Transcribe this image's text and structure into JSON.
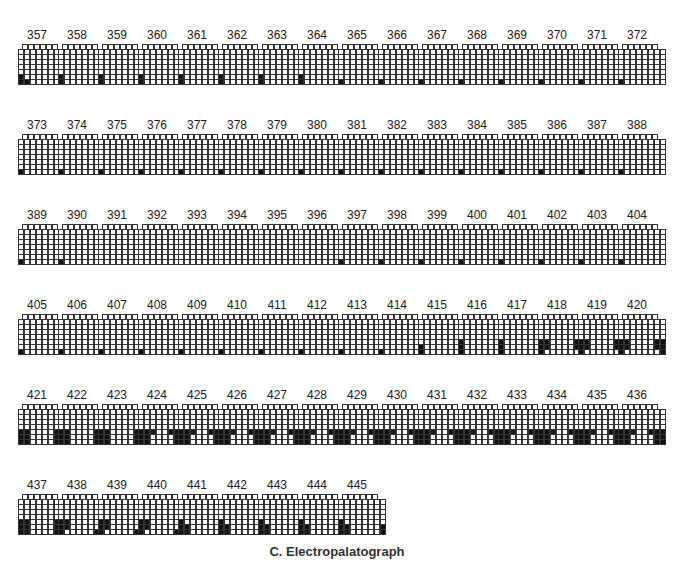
{
  "caption": "C. Electropalatograph",
  "grid_spec": {
    "rows": 8,
    "row0_cells": 6,
    "other_row_cells": 8
  },
  "layout": {
    "row_tops": [
      28,
      118,
      208,
      298,
      388,
      478
    ],
    "col_lefts": [
      18,
      58,
      98,
      138,
      178,
      218,
      258,
      298,
      338,
      378,
      418,
      458,
      498,
      538,
      578,
      618
    ],
    "per_row": 16
  },
  "patterns": {
    "p_cornersL2R1": [
      [
        6,
        0
      ],
      [
        7,
        0
      ],
      [
        7,
        1
      ],
      [
        6,
        7
      ],
      [
        7,
        7
      ]
    ],
    "p_cornersL2R1b": [
      [
        6,
        0
      ],
      [
        7,
        0
      ],
      [
        7,
        7
      ]
    ],
    "p_L2": [
      [
        6,
        0
      ],
      [
        7,
        0
      ]
    ],
    "p_L1": [
      [
        7,
        0
      ]
    ],
    "p_none": [],
    "p_L1R1": [
      [
        7,
        0
      ],
      [
        7,
        7
      ]
    ],
    "p_L2R2": [
      [
        6,
        0
      ],
      [
        7,
        0
      ],
      [
        6,
        7
      ],
      [
        7,
        7
      ]
    ],
    "p_L2R2w": [
      [
        5,
        0
      ],
      [
        6,
        0
      ],
      [
        7,
        0
      ],
      [
        5,
        7
      ],
      [
        6,
        7
      ],
      [
        7,
        7
      ]
    ],
    "p_418": [
      [
        5,
        0
      ],
      [
        5,
        1
      ],
      [
        5,
        6
      ],
      [
        5,
        7
      ],
      [
        6,
        0
      ],
      [
        6,
        1
      ],
      [
        6,
        6
      ],
      [
        6,
        7
      ],
      [
        7,
        0
      ],
      [
        7,
        7
      ]
    ],
    "p_wide": [
      [
        5,
        0
      ],
      [
        5,
        1
      ],
      [
        5,
        2
      ],
      [
        5,
        5
      ],
      [
        5,
        6
      ],
      [
        5,
        7
      ],
      [
        6,
        0
      ],
      [
        6,
        1
      ],
      [
        6,
        6
      ],
      [
        6,
        7
      ],
      [
        7,
        0
      ],
      [
        7,
        1
      ],
      [
        7,
        6
      ],
      [
        7,
        7
      ]
    ],
    "p_wide2": [
      [
        5,
        0
      ],
      [
        5,
        1
      ],
      [
        5,
        6
      ],
      [
        5,
        7
      ],
      [
        6,
        0
      ],
      [
        6,
        1
      ],
      [
        6,
        6
      ],
      [
        6,
        7
      ],
      [
        7,
        0
      ],
      [
        7,
        1
      ],
      [
        7,
        6
      ],
      [
        7,
        7
      ]
    ],
    "p_late": [
      [
        5,
        0
      ],
      [
        5,
        1
      ],
      [
        6,
        0
      ],
      [
        6,
        1
      ],
      [
        7,
        0
      ],
      [
        7,
        6
      ],
      [
        7,
        7
      ],
      [
        6,
        7
      ]
    ],
    "p_late2": [
      [
        5,
        0
      ],
      [
        6,
        0
      ],
      [
        6,
        1
      ],
      [
        7,
        0
      ],
      [
        7,
        1
      ],
      [
        7,
        7
      ],
      [
        6,
        7
      ]
    ]
  },
  "frames": [
    {
      "label": "357",
      "pattern": "p_cornersL2R1"
    },
    {
      "label": "358",
      "pattern": "p_cornersL2R1b"
    },
    {
      "label": "359",
      "pattern": "p_cornersL2R1b"
    },
    {
      "label": "360",
      "pattern": "p_cornersL2R1b"
    },
    {
      "label": "361",
      "pattern": "p_cornersL2R1b"
    },
    {
      "label": "362",
      "pattern": "p_L2"
    },
    {
      "label": "363",
      "pattern": "p_L2"
    },
    {
      "label": "364",
      "pattern": "p_L2"
    },
    {
      "label": "365",
      "pattern": "p_L1"
    },
    {
      "label": "366",
      "pattern": "p_L1"
    },
    {
      "label": "367",
      "pattern": "p_L1"
    },
    {
      "label": "368",
      "pattern": "p_L1"
    },
    {
      "label": "369",
      "pattern": "p_L1"
    },
    {
      "label": "370",
      "pattern": "p_L1"
    },
    {
      "label": "371",
      "pattern": "p_L1"
    },
    {
      "label": "372",
      "pattern": "p_L1"
    },
    {
      "label": "373",
      "pattern": "p_L1"
    },
    {
      "label": "374",
      "pattern": "p_L1"
    },
    {
      "label": "375",
      "pattern": "p_L1"
    },
    {
      "label": "376",
      "pattern": "p_L1"
    },
    {
      "label": "377",
      "pattern": "p_L1"
    },
    {
      "label": "378",
      "pattern": "p_L1"
    },
    {
      "label": "379",
      "pattern": "p_L1"
    },
    {
      "label": "380",
      "pattern": "p_L1"
    },
    {
      "label": "381",
      "pattern": "p_L1"
    },
    {
      "label": "382",
      "pattern": "p_L1"
    },
    {
      "label": "383",
      "pattern": "p_L1"
    },
    {
      "label": "384",
      "pattern": "p_L1"
    },
    {
      "label": "385",
      "pattern": "p_L1"
    },
    {
      "label": "386",
      "pattern": "p_L1"
    },
    {
      "label": "387",
      "pattern": "p_L1"
    },
    {
      "label": "388",
      "pattern": "p_L1"
    },
    {
      "label": "389",
      "pattern": "p_L1"
    },
    {
      "label": "390",
      "pattern": "p_L1"
    },
    {
      "label": "391",
      "pattern": "p_none"
    },
    {
      "label": "392",
      "pattern": "p_none"
    },
    {
      "label": "393",
      "pattern": "p_none"
    },
    {
      "label": "394",
      "pattern": "p_none"
    },
    {
      "label": "395",
      "pattern": "p_none"
    },
    {
      "label": "396",
      "pattern": "p_none"
    },
    {
      "label": "397",
      "pattern": "p_L1"
    },
    {
      "label": "398",
      "pattern": "p_L1"
    },
    {
      "label": "399",
      "pattern": "p_L1"
    },
    {
      "label": "400",
      "pattern": "p_L1"
    },
    {
      "label": "401",
      "pattern": "p_L1"
    },
    {
      "label": "402",
      "pattern": "p_L1"
    },
    {
      "label": "403",
      "pattern": "p_L1"
    },
    {
      "label": "404",
      "pattern": "p_L1"
    },
    {
      "label": "405",
      "pattern": "p_L1"
    },
    {
      "label": "406",
      "pattern": "p_L1"
    },
    {
      "label": "407",
      "pattern": "p_L1"
    },
    {
      "label": "408",
      "pattern": "p_L1"
    },
    {
      "label": "409",
      "pattern": "p_L1"
    },
    {
      "label": "410",
      "pattern": "p_L1"
    },
    {
      "label": "411",
      "pattern": "p_L1"
    },
    {
      "label": "412",
      "pattern": "p_L1"
    },
    {
      "label": "413",
      "pattern": "p_L1R1"
    },
    {
      "label": "414",
      "pattern": "p_L1R1"
    },
    {
      "label": "415",
      "pattern": "p_L2R2"
    },
    {
      "label": "416",
      "pattern": "p_L2R2w"
    },
    {
      "label": "417",
      "pattern": "p_L2R2w"
    },
    {
      "label": "418",
      "pattern": "p_418"
    },
    {
      "label": "419",
      "pattern": "p_418"
    },
    {
      "label": "420",
      "pattern": "p_418"
    },
    {
      "label": "421",
      "pattern": "p_wide2"
    },
    {
      "label": "422",
      "pattern": "p_wide2"
    },
    {
      "label": "423",
      "pattern": "p_wide2"
    },
    {
      "label": "424",
      "pattern": "p_wide"
    },
    {
      "label": "425",
      "pattern": "p_wide"
    },
    {
      "label": "426",
      "pattern": "p_wide"
    },
    {
      "label": "427",
      "pattern": "p_wide"
    },
    {
      "label": "428",
      "pattern": "p_wide"
    },
    {
      "label": "429",
      "pattern": "p_wide"
    },
    {
      "label": "430",
      "pattern": "p_wide"
    },
    {
      "label": "431",
      "pattern": "p_wide"
    },
    {
      "label": "432",
      "pattern": "p_wide"
    },
    {
      "label": "433",
      "pattern": "p_wide"
    },
    {
      "label": "434",
      "pattern": "p_wide"
    },
    {
      "label": "435",
      "pattern": "p_wide"
    },
    {
      "label": "436",
      "pattern": "p_wide"
    },
    {
      "label": "437",
      "pattern": "p_wide2"
    },
    {
      "label": "438",
      "pattern": "p_late"
    },
    {
      "label": "439",
      "pattern": "p_late"
    },
    {
      "label": "440",
      "pattern": "p_late"
    },
    {
      "label": "441",
      "pattern": "p_late2"
    },
    {
      "label": "442",
      "pattern": "p_late2"
    },
    {
      "label": "443",
      "pattern": "p_late2"
    },
    {
      "label": "444",
      "pattern": "p_late2"
    },
    {
      "label": "445",
      "pattern": "p_late2"
    }
  ]
}
